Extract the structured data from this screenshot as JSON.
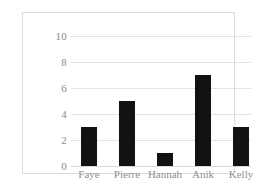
{
  "chart_data": {
    "type": "bar",
    "title": "",
    "subtitle": "",
    "xlabel": "",
    "ylabel": "",
    "categories": [
      "Faye",
      "Pierre",
      "Hannah",
      "Anik",
      "Kelly"
    ],
    "values": [
      3,
      5,
      1,
      7,
      3
    ],
    "ylim": [
      0,
      10
    ],
    "yticks": [
      0,
      2,
      4,
      6,
      8,
      10
    ],
    "ytick_labels": [
      "0",
      "2",
      "4",
      "6",
      "8",
      "10"
    ],
    "grid": true,
    "grid_axis": "y",
    "legend": false,
    "legend_position": "none",
    "bar_color": "#121212",
    "gridline_color": "#e3e3e3",
    "axis_text_color": "#8a8a8a",
    "border_color": "#dcdcdc",
    "background_color": "#ffffff"
  }
}
